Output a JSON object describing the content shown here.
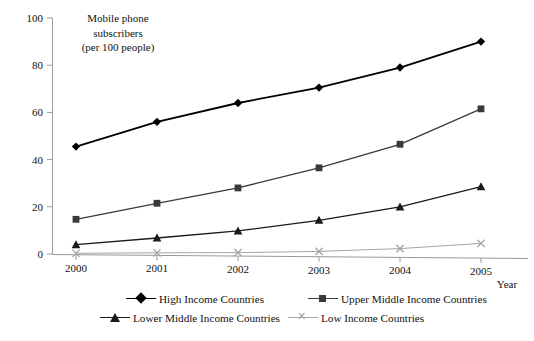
{
  "chart_data": {
    "type": "line",
    "title": "",
    "ylabel": "Mobile phone subscribers (per 100 people)",
    "ylabel_lines": [
      "Mobile phone",
      "subscribers",
      "(per 100 people)"
    ],
    "xlabel": "Year",
    "categories": [
      "2000",
      "2001",
      "2002",
      "2003",
      "2004",
      "2005"
    ],
    "x": [
      2000,
      2001,
      2002,
      2003,
      2004,
      2005
    ],
    "ylim": [
      0,
      100
    ],
    "yticks": [
      0,
      20,
      40,
      60,
      80,
      100
    ],
    "grid": false,
    "legend_position": "bottom",
    "series": [
      {
        "name": "High Income Countries",
        "marker": "diamond",
        "color": "#000000",
        "values": [
          45.5,
          56.0,
          64.0,
          70.5,
          79.0,
          90.0
        ]
      },
      {
        "name": "Upper Middle Income Countries",
        "marker": "square",
        "color": "#3a3a3a",
        "values": [
          14.7,
          21.5,
          28.0,
          36.5,
          46.5,
          61.5
        ]
      },
      {
        "name": "Lower Middle Income Countries",
        "marker": "triangle",
        "color": "#1a1a1a",
        "values": [
          4.0,
          6.8,
          9.8,
          14.3,
          20.0,
          28.5
        ]
      },
      {
        "name": "Low Income Countries",
        "marker": "cross",
        "color": "#a6a6a6",
        "values": [
          0.3,
          0.5,
          0.6,
          1.1,
          2.3,
          4.5
        ]
      }
    ]
  },
  "axes": {
    "y_tick_labels": [
      "0",
      "20",
      "40",
      "60",
      "80",
      "100"
    ],
    "x_tick_labels": [
      "2000",
      "2001",
      "2002",
      "2003",
      "2004",
      "2005"
    ],
    "x_axis_title": "Year"
  },
  "legend": {
    "items": [
      {
        "label": "High Income Countries",
        "marker": "diamond-marker",
        "color": "#000000"
      },
      {
        "label": "Upper Middle Income Countries",
        "marker": "square-marker",
        "color": "#3a3a3a"
      },
      {
        "label": "Lower Middle Income Countries",
        "marker": "triangle-marker",
        "color": "#1a1a1a"
      },
      {
        "label": "Low Income Countries",
        "marker": "cross-marker",
        "color": "#a6a6a6"
      }
    ]
  }
}
